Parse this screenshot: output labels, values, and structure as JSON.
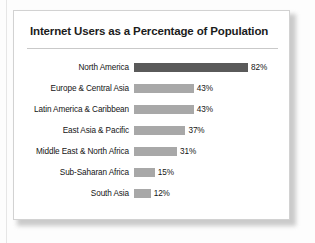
{
  "chart_data": {
    "type": "bar",
    "orientation": "horizontal",
    "title": "Internet Users as a Percentage of Population",
    "xlabel": "",
    "ylabel": "",
    "categories": [
      "North America",
      "Europe & Central Asia",
      "Latin America & Caribbean",
      "East Asia & Pacific",
      "Middle East & North Africa",
      "Sub-Saharan Africa",
      "South Asia"
    ],
    "values": [
      82,
      43,
      43,
      37,
      31,
      15,
      12
    ],
    "value_labels": [
      "82%",
      "43%",
      "43%",
      "37%",
      "31%",
      "15%",
      "12%"
    ],
    "xlim": [
      0,
      82
    ],
    "grid": false,
    "legend": false,
    "bar_colors": [
      "#5a5a5a",
      "#a8a8a8",
      "#a8a8a8",
      "#a8a8a8",
      "#a8a8a8",
      "#a8a8a8",
      "#a8a8a8"
    ],
    "highlight_category": "North America"
  },
  "colors": {
    "bar_default": "#a8a8a8",
    "bar_highlight": "#5a5a5a",
    "card_background": "#ffffff",
    "card_border": "#d2d2d2",
    "title_text": "#1c1c1c",
    "label_text": "#141414",
    "rule": "#c9c9c9"
  }
}
